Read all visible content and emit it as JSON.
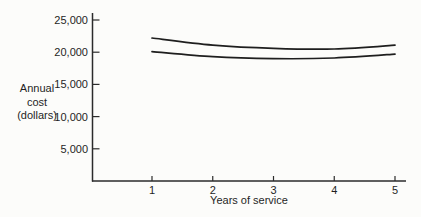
{
  "chart_data": {
    "type": "line",
    "title": "",
    "xlabel": "Years of service",
    "ylabel": "Annual cost (dollars)",
    "ylabel_lines": [
      "Annual",
      "cost",
      "(dollars)"
    ],
    "x": [
      1,
      2,
      3,
      4,
      5
    ],
    "x_tick_labels": [
      "1",
      "2",
      "3",
      "4",
      "5"
    ],
    "y_ticks": [
      5000,
      10000,
      15000,
      20000,
      25000
    ],
    "y_tick_labels": [
      "5,000",
      "10,000",
      "15,000",
      "20,000",
      "25,000"
    ],
    "xlim": [
      0,
      5.2
    ],
    "ylim": [
      0,
      26000
    ],
    "grid": false,
    "series": [
      {
        "name": "upper-cost-curve",
        "values": [
          22200,
          21100,
          20600,
          20500,
          21100
        ]
      },
      {
        "name": "lower-cost-curve",
        "values": [
          20100,
          19300,
          19000,
          19100,
          19700
        ]
      }
    ],
    "line_color": "#1e1e1e",
    "axis_color": "#2b2b2b",
    "background": "#fcfcfa"
  }
}
